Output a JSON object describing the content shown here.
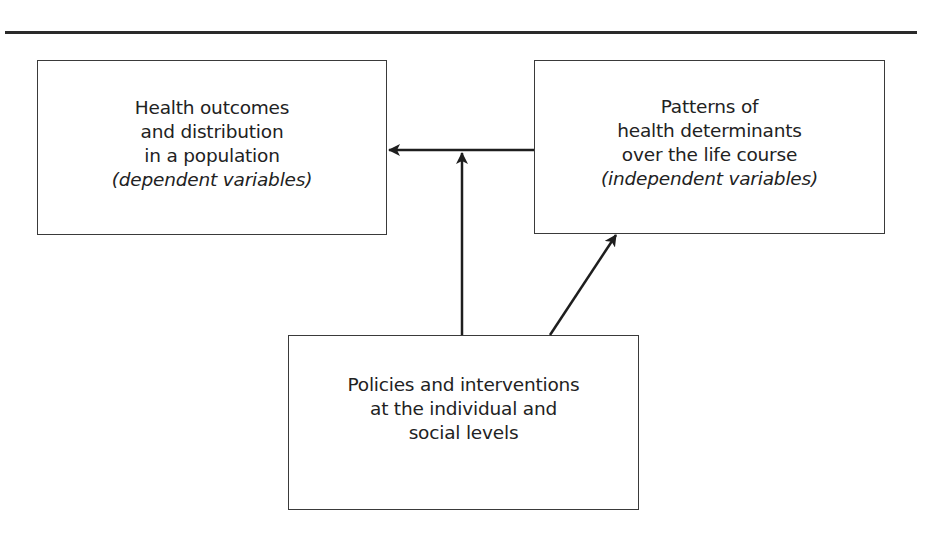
{
  "diagram": {
    "type": "flow",
    "nodes": [
      {
        "id": "outcomes",
        "lines": [
          "Health outcomes",
          "and distribution",
          "in a population"
        ],
        "italic_line": "(dependent variables)"
      },
      {
        "id": "determinants",
        "lines": [
          "Patterns of",
          "health determinants",
          "over the life course"
        ],
        "italic_line": "(independent variables)"
      },
      {
        "id": "policies",
        "lines": [
          "Policies and interventions",
          "at the individual and",
          "social levels"
        ],
        "italic_line": ""
      }
    ],
    "edges": [
      {
        "from": "determinants",
        "to": "outcomes",
        "label": ""
      },
      {
        "from": "policies",
        "to": "determinants-outcomes-link",
        "label": ""
      },
      {
        "from": "policies",
        "to": "determinants",
        "label": ""
      }
    ],
    "colors": {
      "stroke": "#2a2a2a",
      "text": "#222222",
      "background": "#ffffff"
    }
  }
}
